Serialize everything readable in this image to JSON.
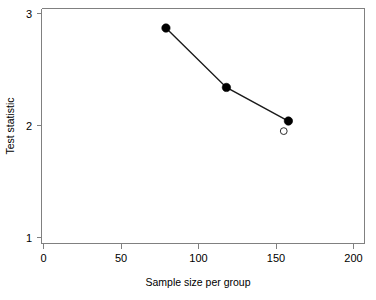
{
  "chart_data": {
    "type": "line",
    "title": "",
    "xlabel": "Sample size per group",
    "ylabel": "Test statistic",
    "xlim": [
      0,
      200
    ],
    "ylim": [
      1,
      3
    ],
    "xticks": [
      0,
      50,
      100,
      150,
      200
    ],
    "xtick_labels": [
      "0",
      "50",
      "100",
      "150",
      "200"
    ],
    "yticks": [
      1,
      2,
      3
    ],
    "ytick_labels": [
      "1",
      "2",
      "3"
    ],
    "grid": false,
    "legend": null,
    "series": [
      {
        "name": "test statistic",
        "marker": "filled-circle",
        "line": "solid",
        "x": [
          79,
          118,
          158
        ],
        "y": [
          2.87,
          2.34,
          2.04
        ]
      },
      {
        "name": "reference point",
        "marker": "open-circle",
        "line": "none",
        "x": [
          155
        ],
        "y": [
          1.95
        ]
      }
    ]
  },
  "axes": {
    "x_title": "Sample size per group",
    "y_title": "Test statistic",
    "x_tick_0": "0",
    "x_tick_1": "50",
    "x_tick_2": "100",
    "x_tick_3": "150",
    "x_tick_4": "200",
    "y_tick_0": "1",
    "y_tick_1": "2",
    "y_tick_2": "3"
  },
  "colors": {
    "axis": "#808080",
    "line": "#1a1a1a",
    "marker_filled": "#000000",
    "marker_open_fill": "#ffffff",
    "marker_open_stroke": "#2b2b2b",
    "background": "#ffffff",
    "text": "#000000"
  }
}
